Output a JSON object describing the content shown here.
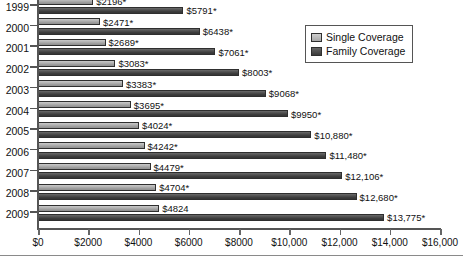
{
  "chart_data": {
    "type": "bar",
    "orientation": "horizontal",
    "title": "",
    "xlabel": "",
    "ylabel": "",
    "categories": [
      "1999",
      "2000",
      "2001",
      "2002",
      "2003",
      "2004",
      "2005",
      "2006",
      "2007",
      "2008",
      "2009"
    ],
    "series": [
      {
        "name": "Single Coverage",
        "color": "#a8a8a8",
        "values": [
          2196,
          2471,
          2689,
          3083,
          3383,
          3695,
          4024,
          4242,
          4479,
          4704,
          4824
        ],
        "labels": [
          "$2196*",
          "$2471*",
          "$2689*",
          "$3083*",
          "$3383*",
          "$3695*",
          "$4024*",
          "$4242*",
          "$4479*",
          "$4704*",
          "$4824"
        ]
      },
      {
        "name": "Family Coverage",
        "color": "#3d3d3d",
        "values": [
          5791,
          6438,
          7061,
          8003,
          9068,
          9950,
          10880,
          11480,
          12106,
          12680,
          13775
        ],
        "labels": [
          "$5791*",
          "$6438*",
          "$7061*",
          "$8003*",
          "$9068*",
          "$9950*",
          "$10,880*",
          "$11,480*",
          "$12,106*",
          "$12,680*",
          "$13,775*"
        ]
      }
    ],
    "xlim": [
      0,
      16000
    ],
    "xticks": [
      0,
      2000,
      4000,
      6000,
      8000,
      10000,
      12000,
      14000,
      16000
    ],
    "xtick_labels": [
      "$0",
      "$2000",
      "$4000",
      "$6000",
      "$8000",
      "$10,000",
      "$12,000",
      "$14,000",
      "$16,000"
    ],
    "grid": false,
    "legend_position": "top-right"
  },
  "legend": {
    "entries": [
      {
        "label": "Single Coverage"
      },
      {
        "label": "Family Coverage"
      }
    ]
  }
}
